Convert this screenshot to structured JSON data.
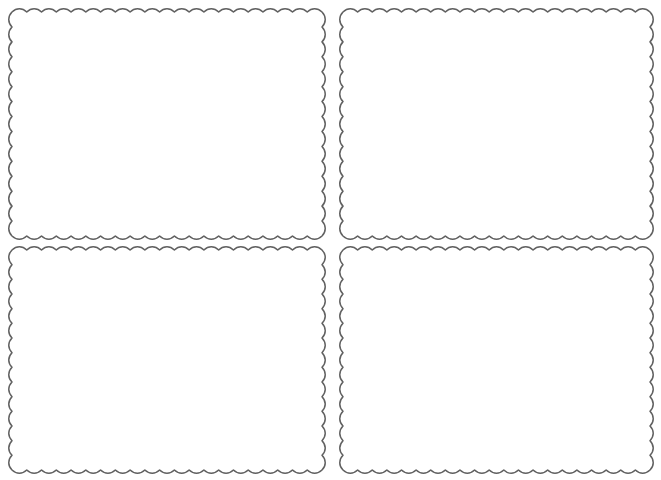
{
  "page": {
    "background_color": "#ffffff",
    "width": 661,
    "height": 480
  },
  "style": {
    "stroke_color": "#616161",
    "stroke_width": 1.5,
    "fill_color": "none",
    "wave_wavelength": 14.5,
    "wave_amplitude": 3.2
  },
  "frames": [
    {
      "name": "frame-top-left",
      "label": "Top left wavy frame",
      "x": 12,
      "y": 12,
      "width": 310,
      "height": 224,
      "content": ""
    },
    {
      "name": "frame-top-right",
      "label": "Top right wavy frame",
      "x": 343,
      "y": 12,
      "width": 307,
      "height": 224,
      "content": ""
    },
    {
      "name": "frame-bottom-left",
      "label": "Bottom left wavy frame",
      "x": 12,
      "y": 250,
      "width": 310,
      "height": 220,
      "content": ""
    },
    {
      "name": "frame-bottom-right",
      "label": "Bottom right wavy frame",
      "x": 343,
      "y": 250,
      "width": 307,
      "height": 220,
      "content": ""
    }
  ]
}
